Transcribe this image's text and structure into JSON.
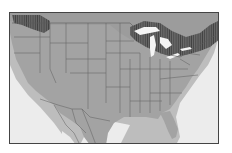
{
  "map": {
    "type": "species-range-map",
    "region": "North America (contiguous US, southern Canada, northern Mexico)",
    "colors": {
      "water": "#ececec",
      "land_outside_range": "#a9a9a9",
      "range_primary": "#8f8f8f",
      "range_secondary_hatched": "#5e5e5e",
      "lakes": "#f4f4f4",
      "borders": "#5a5a5a",
      "frame": "#444444",
      "coastal_halo": "#bdbdbd"
    },
    "legend": null,
    "labels": []
  }
}
